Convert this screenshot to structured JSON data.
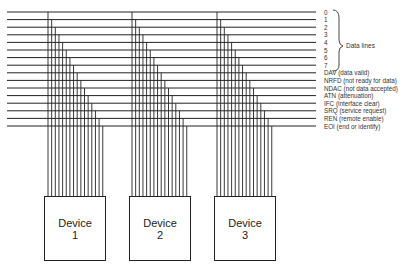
{
  "diagram": {
    "signal_lines": [
      {
        "id": "0",
        "label": "0"
      },
      {
        "id": "1",
        "label": "1"
      },
      {
        "id": "2",
        "label": "2"
      },
      {
        "id": "3",
        "label": "3"
      },
      {
        "id": "4",
        "label": "4"
      },
      {
        "id": "5",
        "label": "5"
      },
      {
        "id": "6",
        "label": "6"
      },
      {
        "id": "7",
        "label": "7"
      },
      {
        "id": "dav",
        "label": "DAV (data valid)"
      },
      {
        "id": "nrfd",
        "label": "NRFD (not ready for data)"
      },
      {
        "id": "ndac",
        "label": "NDAC (not data accepted)"
      },
      {
        "id": "atn",
        "label": "ATN (attenuation)"
      },
      {
        "id": "ifc",
        "label": "IFC (interface clear)"
      },
      {
        "id": "srq",
        "label": "SRQ (service request)"
      },
      {
        "id": "ren",
        "label": "REN (remote enable)"
      },
      {
        "id": "eoi",
        "label": "EOI (end or identify)"
      }
    ],
    "brace_label": "Data lines",
    "devices": [
      {
        "name": "Device",
        "number": "1"
      },
      {
        "name": "Device",
        "number": "2"
      },
      {
        "name": "Device",
        "number": "3"
      }
    ],
    "colors": {
      "line": "#222222",
      "text": "#333333",
      "background": "#ffffff"
    }
  }
}
